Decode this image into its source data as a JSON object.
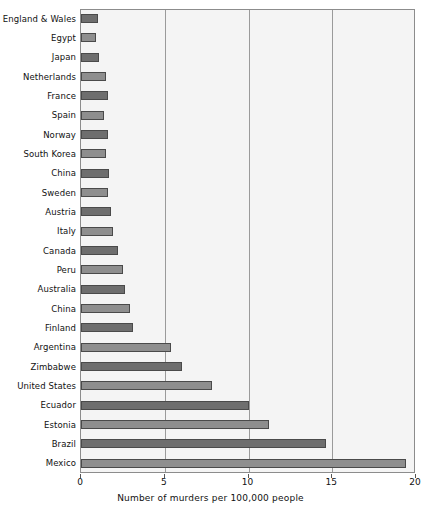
{
  "chart_data": {
    "type": "bar",
    "orientation": "horizontal",
    "title": "",
    "xlabel": "Number of murders per 100,000 people",
    "ylabel": "",
    "xlim": [
      0,
      20
    ],
    "xticks": [
      "0",
      "5",
      "10",
      "15",
      "20"
    ],
    "grid": "vertical",
    "legend": "none",
    "categories": [
      "England & Wales",
      "Egypt",
      "Japan",
      "Netherlands",
      "France",
      "Spain",
      "Norway",
      "South Korea",
      "China",
      "Sweden",
      "Austria",
      "Italy",
      "Canada",
      "Peru",
      "Australia",
      "China",
      "Finland",
      "Argentina",
      "Zimbabwe",
      "United States",
      "Ecuador",
      "Estonia",
      "Brazil",
      "Mexico"
    ],
    "values": [
      1.0,
      0.9,
      1.1,
      1.5,
      1.6,
      1.4,
      1.6,
      1.5,
      1.7,
      1.6,
      1.8,
      1.9,
      2.2,
      2.5,
      2.6,
      2.9,
      3.1,
      5.4,
      6.0,
      7.8,
      10.0,
      11.2,
      14.6,
      19.4
    ],
    "colors": {
      "bar_dark": "#6e6e6e",
      "bar_light": "#8e8e8e",
      "bar_outline": "#4a4a4a",
      "plot_background": "#f4f4f4",
      "gridline": "#9a9a9a",
      "axis": "#8c8c8c",
      "text": "#111111"
    }
  }
}
